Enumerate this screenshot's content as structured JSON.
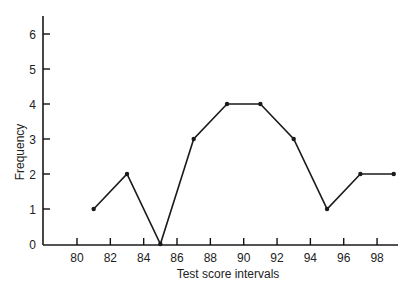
{
  "chart_data": {
    "type": "line",
    "title": "",
    "xlabel": "Test score intervals",
    "ylabel": "Frequency",
    "x": [
      81,
      83,
      85,
      87,
      89,
      91,
      93,
      95,
      97,
      99
    ],
    "values": [
      1,
      2,
      0,
      3,
      4,
      4,
      3,
      1,
      2,
      2
    ],
    "series": [
      {
        "name": "Frequency",
        "x": [
          81,
          83,
          85,
          87,
          89,
          91,
          93,
          95,
          97,
          99
        ],
        "values": [
          1,
          2,
          0,
          3,
          4,
          4,
          3,
          1,
          2,
          2
        ]
      }
    ],
    "xticks": [
      80,
      82,
      84,
      86,
      88,
      90,
      92,
      94,
      96,
      98
    ],
    "yticks": [
      0,
      1,
      2,
      3,
      4,
      5,
      6
    ],
    "xlim": [
      78,
      99.3
    ],
    "ylim": [
      0,
      6.5
    ],
    "grid": false,
    "legend": null,
    "colors": {
      "line": "#1a1a1a",
      "axis": "#1a1a1a",
      "marker": "#1a1a1a"
    }
  }
}
